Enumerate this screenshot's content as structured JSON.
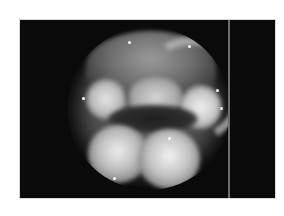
{
  "image": {
    "kind": "grayscale endoscopic photograph",
    "background_color": "#ffffff",
    "frame_color": "#0a0a0a",
    "divider_color": "#6e6e6e",
    "scope_view": "circular"
  }
}
